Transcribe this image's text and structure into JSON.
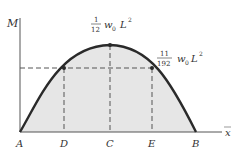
{
  "diagram": {
    "y_axis_label": "M",
    "x_axis_label": "x",
    "points": {
      "A": "A",
      "D": "D",
      "C": "C",
      "E": "E",
      "B": "B"
    },
    "annotations": {
      "peak": {
        "num": "1",
        "den": "12",
        "w": "w",
        "sub": "0",
        "L": "L",
        "exp": "2"
      },
      "side": {
        "num": "11",
        "den": "192",
        "w": "w",
        "sub": "0",
        "L": "L",
        "exp": "2"
      }
    },
    "colors": {
      "fill": "#e6e6e6",
      "curve": "#2a2a2a",
      "axis": "#555555",
      "dash": "#555555"
    }
  }
}
